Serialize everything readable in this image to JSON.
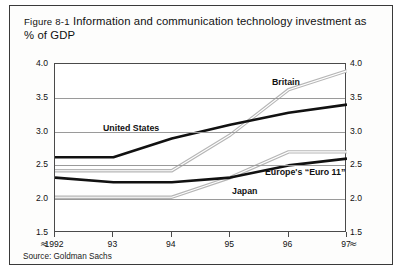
{
  "figure": {
    "number": "Figure 8-1",
    "title": "Information and communication technology investment as % of GDP",
    "source": "Source: Goldman Sachs"
  },
  "axes": {
    "y_ticks": [
      "1.5",
      "2.0",
      "2.5",
      "3.0",
      "3.5",
      "4.0"
    ],
    "x_ticks": [
      "1992",
      "93",
      "94",
      "95",
      "96",
      "97"
    ],
    "break_symbol": "≈"
  },
  "labels": {
    "britain": "Britain",
    "united_states": "United States",
    "japan": "Japan",
    "euro11": "Europe's “Euro 11”"
  },
  "colors": {
    "dark_line": "#111111",
    "light_line": "#b6b6b6",
    "frame": "#4a4a4a",
    "grid": "#9a9a9a",
    "border": "#3a3a3a"
  },
  "chart_data": {
    "type": "line",
    "title": "Figure 8-1 Information and communication technology investment as % of GDP",
    "xlabel": "",
    "ylabel": "% of GDP",
    "x": [
      "1992",
      "93",
      "94",
      "95",
      "96",
      "97"
    ],
    "xlim": [
      1992,
      1997
    ],
    "ylim": [
      1.5,
      4.0
    ],
    "y_ticks": [
      1.5,
      2.0,
      2.5,
      3.0,
      3.5,
      4.0
    ],
    "grid": true,
    "legend": "inline-annotations",
    "dual_y_axis": true,
    "axis_break": true,
    "series": [
      {
        "name": "Britain",
        "style": "light",
        "values": [
          2.42,
          2.42,
          2.42,
          2.95,
          3.62,
          3.9
        ]
      },
      {
        "name": "United States",
        "style": "dark",
        "values": [
          2.62,
          2.62,
          2.9,
          3.1,
          3.28,
          3.4
        ]
      },
      {
        "name": "Japan",
        "style": "light",
        "values": [
          2.03,
          2.03,
          2.03,
          2.32,
          2.7,
          2.7
        ]
      },
      {
        "name": "Europe's “Euro 11”",
        "style": "dark",
        "values": [
          2.32,
          2.25,
          2.25,
          2.32,
          2.5,
          2.6
        ]
      }
    ]
  }
}
